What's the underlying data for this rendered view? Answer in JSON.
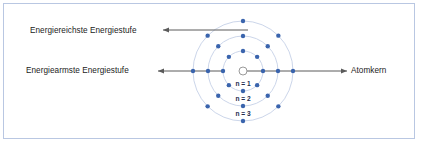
{
  "figure": {
    "background_color": "#ffffff",
    "border_color": "#b9c7e2"
  },
  "labels": {
    "highest_energy_level": "Energiereichste Energiestufe",
    "lowest_energy_level": "Energiearmste Energiestufe",
    "nucleus": "Atomkern"
  },
  "shell_labels": [
    {
      "text": "n = 1"
    },
    {
      "text": "n = 2"
    },
    {
      "text": "n = 3"
    }
  ],
  "colors": {
    "electron": "#3a64ad",
    "shell_ring": "#ccd6ea",
    "nucleus_outline": "#9a9a9a",
    "arrow": "#5a5a5a",
    "shell_label_text": "#232c4d",
    "label_text": "#1b1b1b"
  },
  "chart_data": {
    "type": "scatter",
    "center": {
      "x": 243,
      "y": 71
    },
    "nucleus": {
      "radius": 4,
      "fill": "#ffffff",
      "stroke": "#9a9a9a"
    },
    "shells": [
      {
        "n": 1,
        "label": "n = 1",
        "radius": 20,
        "electron_count": 8,
        "electron_angles_deg": [
          0,
          45,
          90,
          135,
          180,
          225,
          270,
          315
        ]
      },
      {
        "n": 2,
        "label": "n = 2",
        "radius": 35,
        "electron_count": 8,
        "electron_angles_deg": [
          0,
          45,
          90,
          135,
          180,
          225,
          270,
          315
        ]
      },
      {
        "n": 3,
        "label": "n = 3",
        "radius": 50,
        "electron_count": 8,
        "electron_angles_deg": [
          0,
          45,
          90,
          135,
          180,
          225,
          270,
          315
        ]
      }
    ],
    "annotations": [
      {
        "text": "Energiereichste Energiestufe",
        "arrow_from": {
          "x": 248,
          "y": 30
        },
        "arrow_to": {
          "x": 163,
          "y": 30
        },
        "direction": "left"
      },
      {
        "text": "Energiearmste Energiestufe",
        "arrow_from": {
          "x": 223,
          "y": 71
        },
        "arrow_to": {
          "x": 158,
          "y": 71
        },
        "direction": "left"
      },
      {
        "text": "Atomkern",
        "arrow_from": {
          "x": 243,
          "y": 71
        },
        "arrow_to": {
          "x": 347,
          "y": 71
        },
        "direction": "right"
      }
    ]
  }
}
